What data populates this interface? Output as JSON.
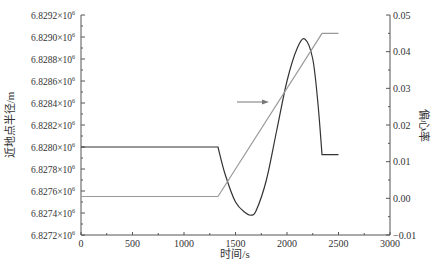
{
  "chart_data": {
    "type": "line",
    "title": "",
    "xlabel": "时间/s",
    "ylabel_left": "近地点半径/m",
    "ylabel_right": "偏心率",
    "xlim": [
      0,
      3000
    ],
    "ylim_left": [
      6.8272,
      6.8292
    ],
    "ylim_right": [
      -0.01,
      0.05
    ],
    "x_ticks": [
      "0",
      "500",
      "1000",
      "1500",
      "2000",
      "2500",
      "3000"
    ],
    "y_left_ticks": [
      "6.8272×10⁶",
      "6.8274×10⁶",
      "6.8276×10⁶",
      "6.8278×10⁶",
      "6.8280×10⁶",
      "6.8282×10⁶",
      "6.8284×10⁶",
      "6.8286×10⁶",
      "6.8288×10⁶",
      "6.8290×10⁶",
      "6.8292×10⁶"
    ],
    "y_right_ticks": [
      "−0.01",
      "0.00",
      "0.01",
      "0.02",
      "0.03",
      "0.04",
      "0.05"
    ],
    "grid": false,
    "legend": "none",
    "annotation": "arrow pointing right toward eccentricity line near t≈1800 s",
    "series": [
      {
        "name": "近地点半径 (perigee radius, ×10⁶ m)",
        "axis": "left",
        "color": "#333333",
        "x": [
          0,
          1330,
          1400,
          1500,
          1600,
          1650,
          1700,
          1800,
          1900,
          2000,
          2100,
          2175,
          2250,
          2300,
          2340,
          2500
        ],
        "values": [
          6.828,
          6.828,
          6.82775,
          6.8275,
          6.8274,
          6.82738,
          6.82742,
          6.8277,
          6.82815,
          6.8286,
          6.8289,
          6.82898,
          6.8288,
          6.8284,
          6.82793,
          6.82793
        ]
      },
      {
        "name": "偏心率 (eccentricity)",
        "axis": "right",
        "color": "#999999",
        "x": [
          0,
          1330,
          2340,
          2500
        ],
        "values": [
          0.0005,
          0.0005,
          0.045,
          0.045
        ]
      }
    ]
  }
}
